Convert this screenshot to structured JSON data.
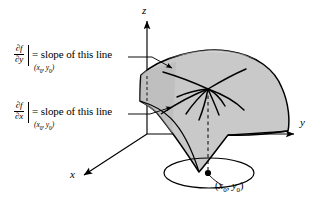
{
  "figure": {
    "kind": "3d-surface-partial-derivatives-diagram",
    "background_color": "#ffffff",
    "ink_color": "#000000",
    "surface_fill_color": "#c9c9c9",
    "surface_fill_color_dark": "#b0b0b0"
  },
  "axes": {
    "z_label": "z",
    "y_label": "y",
    "x_label": "x"
  },
  "labels": {
    "partial_y": {
      "numerator": "∂f",
      "denominator": "∂y",
      "eval_open": "(",
      "eval_x": "x",
      "eval_x_sub": "0",
      "eval_sep": ", ",
      "eval_y": "y",
      "eval_y_sub": "0",
      "eval_close": ")",
      "equation_text": "= slope of this line"
    },
    "partial_x": {
      "numerator": "∂f",
      "denominator": "∂x",
      "eval_open": "(",
      "eval_x": "x",
      "eval_x_sub": "0",
      "eval_sep": ", ",
      "eval_y": "y",
      "eval_y_sub": "0",
      "eval_close": ")",
      "equation_text": "= slope of this line"
    },
    "point": {
      "open": "(",
      "x": "x",
      "x_sub": "0",
      "sep": ", ",
      "y": "y",
      "y_sub": "0",
      "close": ")"
    }
  },
  "icons": {
    "axis_arrow": "arrow-head-icon",
    "leader_arrow": "leader-arrow-icon",
    "point_marker": "filled-dot-icon"
  }
}
